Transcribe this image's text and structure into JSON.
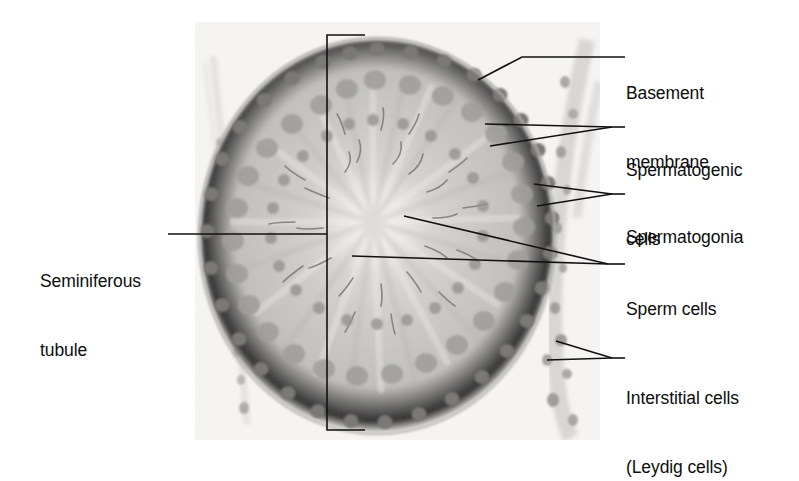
{
  "figure": {
    "type": "histology-micrograph-with-labels",
    "image": {
      "name": "seminiferous-tubule-micrograph",
      "description": "Grayscale light micrograph of a round seminiferous tubule cross section surrounded by interstitial tissue",
      "x": 195,
      "y": 22,
      "width": 405,
      "height": 418,
      "background_color": "#f4f4f2",
      "tissue_color": "#b9b8b4",
      "nucleus_color": "#6e6c6a"
    },
    "bracket": {
      "name": "seminiferous-epithelium-bracket",
      "color": "#111111",
      "top_y": 35,
      "bottom_y": 430,
      "vertical_x": 327,
      "top_tick_x2": 365,
      "bottom_tick_x2": 365
    },
    "labels": [
      {
        "id": "basement-membrane",
        "text": "Basement\nmembrane",
        "lines": [
          "Basement",
          "membrane"
        ],
        "side": "right",
        "x": 626,
        "y": 36,
        "leader": [
          [
            478,
            80
          ],
          [
            522,
            57
          ],
          [
            625,
            57
          ]
        ]
      },
      {
        "id": "spermatogenic-cells",
        "text": "Spermatogenic\ncells",
        "lines": [
          "Spermatogenic",
          "cells"
        ],
        "side": "right",
        "x": 626,
        "y": 113,
        "leader_fan": [
          [
            [
              485,
              124
            ],
            [
              612,
              127
            ]
          ],
          [
            [
              490,
              146
            ],
            [
              612,
              127
            ]
          ]
        ],
        "leader_stub": [
          [
            612,
            127
          ],
          [
            625,
            127
          ]
        ]
      },
      {
        "id": "spermatogonia",
        "text": "Spermatogonia",
        "lines": [
          "Spermatogonia"
        ],
        "side": "right",
        "x": 626,
        "y": 180,
        "leader_fan": [
          [
            [
              534,
              184
            ],
            [
              612,
              194
            ]
          ],
          [
            [
              537,
              206
            ],
            [
              612,
              194
            ]
          ]
        ],
        "leader_stub": [
          [
            612,
            194
          ],
          [
            625,
            194
          ]
        ]
      },
      {
        "id": "sperm-cells",
        "text": "Sperm cells",
        "lines": [
          "Sperm cells"
        ],
        "side": "right",
        "x": 626,
        "y": 252,
        "leader_fan": [
          [
            [
              404,
              216
            ],
            [
              608,
              264
            ]
          ],
          [
            [
              352,
              256
            ],
            [
              608,
              264
            ]
          ]
        ],
        "leader_stub": [
          [
            608,
            264
          ],
          [
            625,
            264
          ]
        ]
      },
      {
        "id": "interstitial-cells",
        "text": "Interstitial cells\n(Leydig cells)",
        "lines": [
          "Interstitial cells",
          "(Leydig cells)"
        ],
        "side": "right",
        "x": 626,
        "y": 341,
        "leader_fan": [
          [
            [
              556,
              341
            ],
            [
              612,
              358
            ]
          ],
          [
            [
              547,
              360
            ],
            [
              612,
              358
            ]
          ]
        ],
        "leader_stub": [
          [
            612,
            358
          ],
          [
            625,
            358
          ]
        ]
      },
      {
        "id": "seminiferous-tubule",
        "text": "Seminiferous\ntubule",
        "lines": [
          "Seminiferous",
          "tubule"
        ],
        "side": "left",
        "x": 40,
        "y": 224,
        "leader": [
          [
            168,
            234
          ],
          [
            327,
            234
          ]
        ]
      }
    ]
  }
}
